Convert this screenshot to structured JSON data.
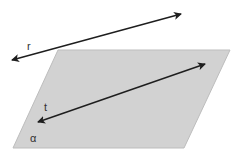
{
  "diagram": {
    "title": "",
    "colors": {
      "plane_fill": "#d2d2d2",
      "plane_edge": "#bdbdbd",
      "line": "#1e1e1e",
      "label": "#333333"
    },
    "plane": {
      "label": "α",
      "points": "58,50 230,50 184,148 13,148"
    },
    "lines": [
      {
        "id": "r",
        "label": "r",
        "x1": 12,
        "y1": 60,
        "x2": 181,
        "y2": 14,
        "arrows": "both",
        "relation": "outside plane"
      },
      {
        "id": "t",
        "label": "t",
        "x1": 38,
        "y1": 122,
        "x2": 205,
        "y2": 64,
        "arrows": "both",
        "relation": "lies in plane"
      }
    ],
    "labels": {
      "r": "r",
      "t": "t",
      "alpha": "α"
    }
  }
}
